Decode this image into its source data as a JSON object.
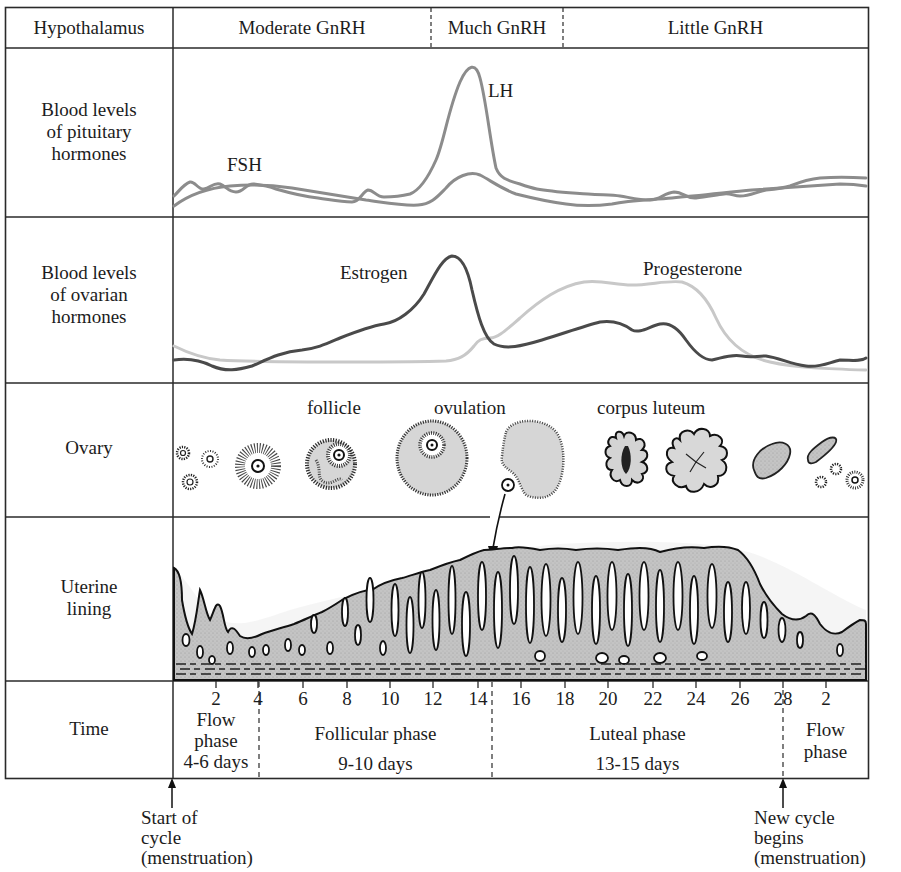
{
  "rows": {
    "hypothalamus": {
      "label": "Hypothalamus",
      "segments": [
        "Moderate GnRH",
        "Much GnRH",
        "Little GnRH"
      ]
    },
    "pituitary": {
      "label_lines": [
        "Blood levels",
        "of pituitary",
        "hormones"
      ],
      "curve_labels": {
        "fsh": "FSH",
        "lh": "LH"
      }
    },
    "ovarian": {
      "label_lines": [
        "Blood levels",
        "of ovarian",
        "hormones"
      ],
      "curve_labels": {
        "estrogen": "Estrogen",
        "progesterone": "Progesterone"
      }
    },
    "ovary": {
      "label": "Ovary",
      "stage_labels": {
        "follicle": "follicle",
        "ovulation": "ovulation",
        "corpus_luteum": "corpus luteum"
      }
    },
    "uterine": {
      "label_lines": [
        "Uterine",
        "lining"
      ]
    },
    "time": {
      "label": "Time",
      "ticks": [
        "2",
        "4",
        "6",
        "8",
        "10",
        "12",
        "14",
        "16",
        "18",
        "20",
        "22",
        "24",
        "26",
        "28",
        "2"
      ],
      "phases": {
        "flow1": [
          "Flow",
          "phase",
          "4-6 days"
        ],
        "follicular": [
          "Follicular phase",
          "9-10 days"
        ],
        "luteal": [
          "Luteal phase",
          "13-15 days"
        ],
        "flow2": [
          "Flow",
          "phase"
        ]
      }
    }
  },
  "annotations": {
    "start": [
      "Start of",
      "cycle",
      "(menstruation)"
    ],
    "new_cycle": [
      "New cycle",
      "begins",
      "(menstruation)"
    ]
  },
  "colors": {
    "border": "#2a2a2a",
    "pituitary_curve": "#8c8c8c",
    "estrogen_curve": "#4a4a4a",
    "progesterone_curve": "#c8c8c8",
    "tissue_fill": "#c9c9c9",
    "follicle_fill": "#d6d6d6"
  }
}
